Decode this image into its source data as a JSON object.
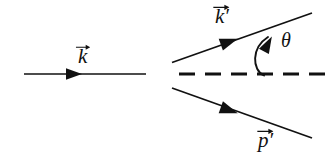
{
  "figure": {
    "kind": "feynman-scattering-diagram",
    "width": 336,
    "height": 165,
    "background_color": "#ffffff",
    "stroke_color": "#111111"
  },
  "labels": {
    "incoming_momentum": "k",
    "incoming_momentum_prime": "",
    "outgoing_photon_momentum": "k",
    "outgoing_photon_momentum_prime": "′",
    "outgoing_particle_momentum": "p",
    "outgoing_particle_momentum_prime": "′",
    "scattering_angle": "θ"
  },
  "elements": {
    "incoming_line": {
      "name": "incoming momentum line",
      "style": "solid",
      "x1": 24,
      "y1": 74,
      "x2": 146,
      "y2": 74,
      "arrow_at_x": 78,
      "arrow_at_y": 74,
      "arrow_direction": "right"
    },
    "axis_line": {
      "name": "dashed reference axis",
      "style": "dashed",
      "x1": 178,
      "y1": 74,
      "x2": 331,
      "y2": 74,
      "dash_length": 16,
      "gap_length": 10,
      "dash_count": 5
    },
    "upper_line": {
      "name": "scattered photon line",
      "style": "solid",
      "x1": 172,
      "y1": 62,
      "x2": 312,
      "y2": 13,
      "angle_degrees": -19,
      "arrow_at_x": 234,
      "arrow_at_y": 40,
      "arrow_direction": "up-right"
    },
    "lower_line": {
      "name": "recoil particle line",
      "style": "solid",
      "x1": 172,
      "y1": 88,
      "x2": 312,
      "y2": 138,
      "angle_degrees": 20,
      "arrow_at_x": 234,
      "arrow_at_y": 112,
      "arrow_direction": "down-right"
    },
    "angle_arc": {
      "name": "scattering angle arc",
      "start_x": 263,
      "start_y": 74,
      "end_x": 272,
      "end_y": 34,
      "arrow_direction": "up",
      "arrow_at_x": 271,
      "arrow_at_y": 44
    }
  }
}
